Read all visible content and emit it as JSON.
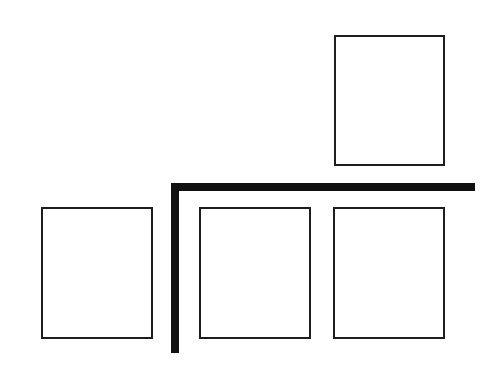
{
  "diagram": {
    "colors": {
      "background": "#ffffff",
      "box_border": "#1e1e1e",
      "divider": "#111111"
    },
    "boxes": [
      {
        "id": "top-right",
        "x": 334,
        "y": 35,
        "w": 111,
        "h": 131,
        "label": ""
      },
      {
        "id": "bottom-left",
        "x": 41,
        "y": 207,
        "w": 112,
        "h": 132,
        "label": ""
      },
      {
        "id": "bottom-middle",
        "x": 199,
        "y": 207,
        "w": 112,
        "h": 132,
        "label": ""
      },
      {
        "id": "bottom-right",
        "x": 333,
        "y": 207,
        "w": 112,
        "h": 132,
        "label": ""
      }
    ],
    "divider": {
      "horizontal": {
        "x": 171,
        "y": 183,
        "w": 304,
        "h": 8
      },
      "vertical": {
        "x": 171,
        "y": 183,
        "w": 8,
        "h": 170
      }
    }
  }
}
